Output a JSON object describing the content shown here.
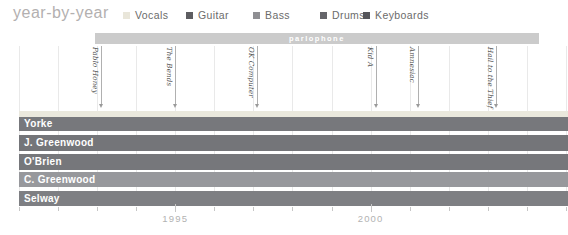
{
  "title": "year-by-year",
  "legend": {
    "items": [
      {
        "label": "Vocals",
        "color": "#e9e6da"
      },
      {
        "label": "Guitar",
        "color": "#5d5d61"
      },
      {
        "label": "Bass",
        "color": "#8f8f93"
      },
      {
        "label": "Drums",
        "color": "#65656a"
      },
      {
        "label": "Keyboards",
        "color": "#55555a"
      }
    ]
  },
  "chart_data": {
    "type": "bar",
    "subtype": "gantt-member-timeline",
    "title": "year-by-year",
    "x_axis": {
      "min": 1991,
      "max": 2005,
      "tick_every": 1,
      "labeled_ticks": [
        "1995",
        "2000"
      ],
      "grid": true
    },
    "legend_entries": [
      "Vocals",
      "Guitar",
      "Bass",
      "Drums",
      "Keyboards"
    ],
    "record_label_bar": {
      "text": "parlophone",
      "start_year": 1992.95,
      "end_year": 2004.3,
      "color": "#cbcbcb"
    },
    "albums": [
      {
        "name": "Pablo Honey",
        "year": 1993.1
      },
      {
        "name": "The Bends",
        "year": 1995.0
      },
      {
        "name": "OK Computer",
        "year": 1997.1
      },
      {
        "name": "Kid A",
        "year": 2000.15
      },
      {
        "name": "Amnesiac",
        "year": 2001.2
      },
      {
        "name": "Hail to the Thief",
        "year": 2003.2
      }
    ],
    "members": [
      {
        "name": "Yorke",
        "start_year": 1991,
        "end_year": 2005.1,
        "bands": [
          {
            "instrument": "Vocals",
            "color": "#eae8dd"
          },
          {
            "instrument": "Guitar",
            "color": "#77787c"
          }
        ]
      },
      {
        "name": "J. Greenwood",
        "start_year": 1991,
        "end_year": 2005.1,
        "bands": [
          {
            "instrument": "Guitar",
            "color": "#747579"
          }
        ]
      },
      {
        "name": "O'Brien",
        "start_year": 1991,
        "end_year": 2005.1,
        "bands": [
          {
            "instrument": "Guitar",
            "color": "#76777b"
          }
        ]
      },
      {
        "name": "C. Greenwood",
        "start_year": 1991,
        "end_year": 2005.1,
        "bands": [
          {
            "instrument": "Bass",
            "color": "#97989c"
          }
        ]
      },
      {
        "name": "Selway",
        "start_year": 1991,
        "end_year": 2005.1,
        "bands": [
          {
            "instrument": "Drums",
            "color": "#7e7f83"
          }
        ]
      }
    ],
    "axis_labels": [
      {
        "text": "1995",
        "year": 1995
      },
      {
        "text": "2000",
        "year": 2000
      }
    ]
  }
}
